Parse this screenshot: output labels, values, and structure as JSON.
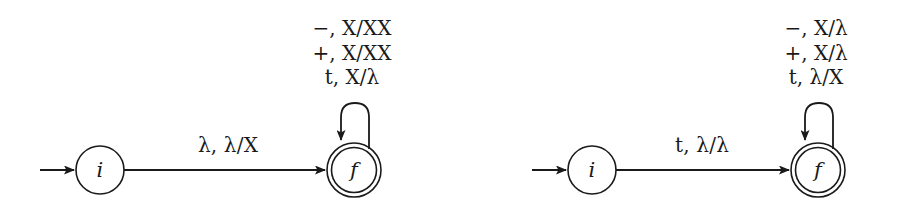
{
  "figure": {
    "type": "state-transition-diagram",
    "background_color": "#ffffff",
    "stroke_color": "#1a1a1a",
    "automata": [
      {
        "id": "left",
        "start_arrow": true,
        "states": [
          {
            "name": "i",
            "label": "i",
            "kind": "initial"
          },
          {
            "name": "f",
            "label": "f",
            "kind": "final"
          }
        ],
        "transition": {
          "from": "i",
          "to": "f",
          "label": "λ, λ/X"
        },
        "self_loop": {
          "on": "f",
          "labels": [
            "−, X/XX",
            "+, X/XX",
            "t, X/λ"
          ]
        }
      },
      {
        "id": "right",
        "start_arrow": true,
        "states": [
          {
            "name": "i",
            "label": "i",
            "kind": "initial"
          },
          {
            "name": "f",
            "label": "f",
            "kind": "final"
          }
        ],
        "transition": {
          "from": "i",
          "to": "f",
          "label": "t, λ/λ"
        },
        "self_loop": {
          "on": "f",
          "labels": [
            "−, X/λ",
            "+, X/λ",
            "t, λ/X"
          ]
        }
      }
    ]
  }
}
